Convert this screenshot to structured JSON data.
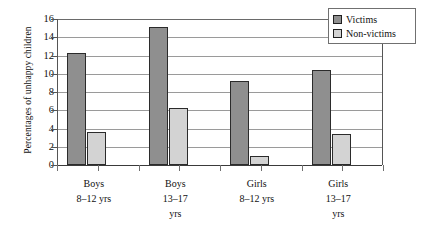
{
  "chart_data": {
    "type": "bar",
    "title": "",
    "xlabel": "",
    "ylabel": "Percentages of unhappy children",
    "ylim": [
      0,
      16
    ],
    "ytick_step": 2,
    "yticks": [
      0,
      2,
      4,
      6,
      8,
      10,
      12,
      14,
      16
    ],
    "ytick_labels": [
      "0",
      "2",
      "4",
      "6",
      "8",
      "10",
      "12",
      "14",
      "16"
    ],
    "grid": true,
    "grid_axis": "y",
    "legend_position": "top-right",
    "categories": [
      "Boys 8–12 yrs",
      "Boys 13–17 yrs",
      "Girls 8–12 yrs",
      "Girls 13–17 yrs"
    ],
    "category_lines": [
      [
        "Boys",
        "8–12 yrs"
      ],
      [
        "Boys",
        "13–17",
        "yrs"
      ],
      [
        "Girls",
        "8–12 yrs"
      ],
      [
        "Girls",
        "13–17",
        "yrs"
      ]
    ],
    "series": [
      {
        "name": "Victims",
        "color": "#8f8f8f",
        "values": [
          12.3,
          15.1,
          9.2,
          10.4
        ]
      },
      {
        "name": "Non-victims",
        "color": "#d3d3d3",
        "values": [
          3.6,
          6.3,
          1.0,
          3.4
        ]
      }
    ]
  },
  "legend": {
    "items": [
      {
        "label": "Victims",
        "color": "#8f8f8f"
      },
      {
        "label": "Non-victims",
        "color": "#d3d3d3"
      }
    ]
  },
  "colors": {
    "victims": "#8f8f8f",
    "non_victims": "#d3d3d3",
    "gridline": "#9a9a9a",
    "axis": "#555555",
    "text": "#111111",
    "background": "#ffffff"
  }
}
